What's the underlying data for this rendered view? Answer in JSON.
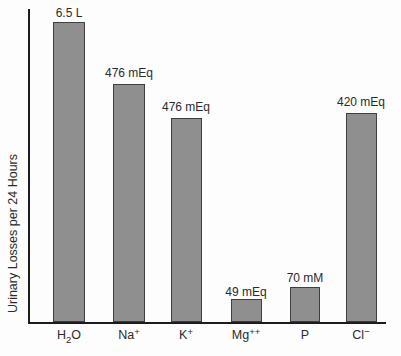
{
  "figure": {
    "ylabel": "Urinary Losses per 24 Hours",
    "bar_color": "#8f8f8f",
    "bar_border_color": "#3f3f3f",
    "axis_color": "#1c1c1c",
    "background_color": "#fdfdfd",
    "text_color": "#2b2b2b"
  },
  "chart_data": {
    "type": "bar",
    "title": "",
    "xlabel": "",
    "ylabel": "Urinary Losses per 24 Hours",
    "categories": [
      "H2O",
      "Na+",
      "K+",
      "Mg++",
      "P",
      "Cl-"
    ],
    "values": [
      6.5,
      476,
      476,
      49,
      70,
      420
    ],
    "units": [
      "L",
      "mEq",
      "mEq",
      "mEq",
      "mM",
      "mEq"
    ],
    "value_labels": [
      "6.5 L",
      "476 mEq",
      "476 mEq",
      "49 mEq",
      "70 mM",
      "420 mEq"
    ],
    "y_axis_ticks": "none",
    "grid": false,
    "legend_position": "none"
  },
  "bars": [
    {
      "name": "H2O",
      "value_label": "6.5 L",
      "cat_pre": "H",
      "cat_sub": "2",
      "cat_post": "O",
      "cat_sup": "",
      "bar_style": "left:53px;top:22px;width:32px;height:300px",
      "value_style": "left:29px;top:6px;width:80px",
      "cat_style": "left:29px;top:328px;width:80px"
    },
    {
      "name": "Na+",
      "value_label": "476 mEq",
      "cat_pre": "Na",
      "cat_sub": "",
      "cat_post": "",
      "cat_sup": "+",
      "bar_style": "left:113px;top:84px;width:32px;height:238px",
      "value_style": "left:89px;top:66px;width:80px",
      "cat_style": "left:89px;top:328px;width:80px"
    },
    {
      "name": "K+",
      "value_label": "476 mEq",
      "cat_pre": "K",
      "cat_sub": "",
      "cat_post": "",
      "cat_sup": "+",
      "bar_style": "left:171px;top:118px;width:31px;height:204px",
      "value_style": "left:146px;top:100px;width:80px",
      "cat_style": "left:146px;top:328px;width:80px"
    },
    {
      "name": "Mg++",
      "value_label": "49 mEq",
      "cat_pre": "Mg",
      "cat_sub": "",
      "cat_post": "",
      "cat_sup": "++",
      "bar_style": "left:231px;top:299px;width:31px;height:23px",
      "value_style": "left:206px;top:285px;width:80px",
      "cat_style": "left:206px;top:328px;width:80px"
    },
    {
      "name": "P",
      "value_label": "70 mM",
      "cat_pre": "P",
      "cat_sub": "",
      "cat_post": "",
      "cat_sup": "",
      "bar_style": "left:290px;top:287px;width:30px;height:35px",
      "value_style": "left:265px;top:271px;width:80px",
      "cat_style": "left:265px;top:328px;width:80px"
    },
    {
      "name": "Cl-",
      "value_label": "420 mEq",
      "cat_pre": "Cl",
      "cat_sub": "",
      "cat_post": "",
      "cat_sup": "−",
      "bar_style": "left:346px;top:113px;width:31px;height:209px",
      "value_style": "left:321px;top:95px;width:80px",
      "cat_style": "left:321px;top:328px;width:80px"
    }
  ]
}
